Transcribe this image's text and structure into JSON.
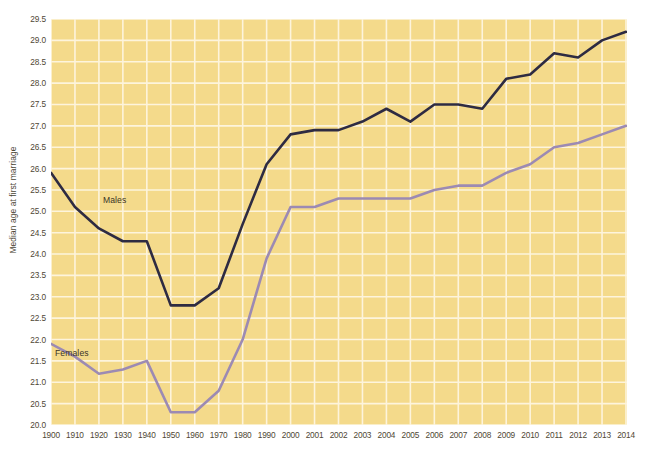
{
  "chart_data": {
    "type": "line",
    "title": "",
    "subtitle": "",
    "xlabel": "",
    "ylabel": "Median age at first marriage",
    "ylim": [
      20.0,
      29.5
    ],
    "grid": true,
    "legend_position": "inline-annotations",
    "x": [
      1900,
      1910,
      1920,
      1930,
      1940,
      1950,
      1960,
      1970,
      1980,
      1990,
      2000,
      2001,
      2002,
      2003,
      2004,
      2005,
      2006,
      2007,
      2008,
      2009,
      2010,
      2011,
      2012,
      2013,
      2014
    ],
    "categories": [
      "1900",
      "1910",
      "1920",
      "1930",
      "1940",
      "1950",
      "1960",
      "1970",
      "1980",
      "1990",
      "2000",
      "2001",
      "2002",
      "2003",
      "2004",
      "2005",
      "2006",
      "2007",
      "2008",
      "2009",
      "2010",
      "2011",
      "2012",
      "2013",
      "2014"
    ],
    "xtick_labels": [
      "1900",
      "1910",
      "1920",
      "1930",
      "1940",
      "1950",
      "1960",
      "1970",
      "1980",
      "1990",
      "2000",
      "2001",
      "2002",
      "2003",
      "2004",
      "2005",
      "2006",
      "2007",
      "2008",
      "2009",
      "2010",
      "2011",
      "2012",
      "2013",
      "2014"
    ],
    "ytick_labels": [
      "29.5",
      "29.0",
      "28.5",
      "28.0",
      "27.5",
      "27.0",
      "26.5",
      "26.0",
      "25.5",
      "25.0",
      "24.5",
      "24.0",
      "23.5",
      "23.0",
      "22.5",
      "22.0",
      "21.5",
      "21.0",
      "20.5",
      "20.0"
    ],
    "ytick_values": [
      29.5,
      29.0,
      28.5,
      28.0,
      27.5,
      27.0,
      26.5,
      26.0,
      25.5,
      25.0,
      24.5,
      24.0,
      23.5,
      23.0,
      22.5,
      22.0,
      21.5,
      21.0,
      20.5,
      20.0
    ],
    "series": [
      {
        "name": "Males",
        "color": "#2e2b42",
        "label_x": 1920,
        "label_y": 25.25,
        "values": [
          25.9,
          25.1,
          24.6,
          24.3,
          24.3,
          22.8,
          22.8,
          23.2,
          24.7,
          26.1,
          26.8,
          26.9,
          26.9,
          27.1,
          27.4,
          27.1,
          27.5,
          27.5,
          27.4,
          28.1,
          28.2,
          28.7,
          28.6,
          29.0,
          29.2
        ]
      },
      {
        "name": "Females",
        "color": "#9c8ab3",
        "label_x": 1921,
        "label_y": 21.65,
        "values": [
          21.9,
          21.6,
          21.2,
          21.3,
          21.5,
          20.3,
          20.3,
          20.8,
          22.0,
          23.9,
          25.1,
          25.1,
          25.3,
          25.3,
          25.3,
          25.3,
          25.5,
          25.6,
          25.6,
          25.9,
          26.1,
          26.5,
          26.6,
          26.8,
          27.0
        ]
      }
    ]
  },
  "style": {
    "plot_background": "#f4da8b",
    "gridline_color": "#fdf4dc",
    "page_background": "#ffffff",
    "tick_text_color": "#4f4734",
    "axis_title_color": "#4a4433"
  }
}
